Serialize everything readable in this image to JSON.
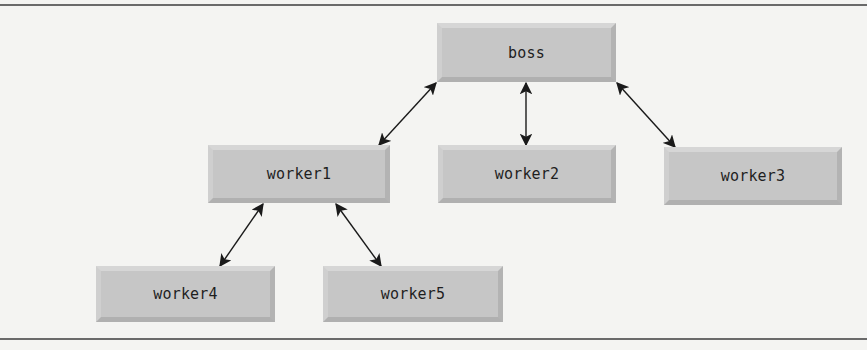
{
  "diagram": {
    "type": "hierarchy",
    "colors": {
      "background": "#f4f4f2",
      "node_fill": "#c6c6c6",
      "node_text": "#1e1e1e",
      "edge": "#1a1a1a",
      "rule": "#6a6a6a"
    },
    "nodes": [
      {
        "id": "boss",
        "label": "boss",
        "x": 437,
        "y": 23,
        "w": 179,
        "h": 59
      },
      {
        "id": "worker1",
        "label": "worker1",
        "x": 208,
        "y": 145,
        "w": 182,
        "h": 58
      },
      {
        "id": "worker2",
        "label": "worker2",
        "x": 438,
        "y": 145,
        "w": 178,
        "h": 58
      },
      {
        "id": "worker3",
        "label": "worker3",
        "x": 664,
        "y": 147,
        "w": 178,
        "h": 58
      },
      {
        "id": "worker4",
        "label": "worker4",
        "x": 96,
        "y": 266,
        "w": 179,
        "h": 56
      },
      {
        "id": "worker5",
        "label": "worker5",
        "x": 323,
        "y": 266,
        "w": 180,
        "h": 56
      }
    ],
    "edges": [
      {
        "from": "boss",
        "to": "worker1",
        "bidirectional": true,
        "x1": 436,
        "y1": 83,
        "x2": 379,
        "y2": 145
      },
      {
        "from": "boss",
        "to": "worker2",
        "bidirectional": true,
        "x1": 526,
        "y1": 83,
        "x2": 526,
        "y2": 145
      },
      {
        "from": "boss",
        "to": "worker3",
        "bidirectional": true,
        "x1": 617,
        "y1": 83,
        "x2": 675,
        "y2": 147
      },
      {
        "from": "worker1",
        "to": "worker4",
        "bidirectional": true,
        "x1": 263,
        "y1": 204,
        "x2": 220,
        "y2": 266
      },
      {
        "from": "worker1",
        "to": "worker5",
        "bidirectional": true,
        "x1": 336,
        "y1": 204,
        "x2": 381,
        "y2": 266
      }
    ]
  }
}
